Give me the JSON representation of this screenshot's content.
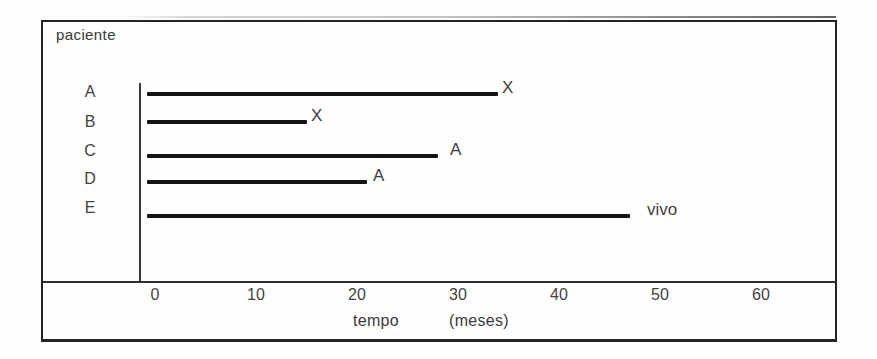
{
  "chart": {
    "y_axis_title": "paciente",
    "x_axis_caption_word": "tempo",
    "x_axis_caption_unit": "(meses)"
  },
  "chart_data": {
    "type": "bar",
    "orientation": "horizontal",
    "title": "",
    "ylabel": "paciente",
    "xlabel": "tempo (meses)",
    "x_ticks": [
      0,
      10,
      20,
      30,
      40,
      50,
      60
    ],
    "xlim": [
      0,
      67
    ],
    "grid": false,
    "legend": false,
    "categories": [
      "A",
      "B",
      "C",
      "D",
      "E"
    ],
    "values": [
      34,
      15,
      28,
      21,
      47
    ],
    "end_markers": [
      "X",
      "X",
      "A",
      "A",
      "vivo"
    ],
    "series": [
      {
        "name": "tempo de seguimento (meses)",
        "values": [
          34,
          15,
          28,
          21,
          47
        ]
      }
    ]
  },
  "colors": {
    "bar_ink": "#141414",
    "axis_ink": "#2e2e2e",
    "text_ink": "#3c3c3c",
    "background": "#fdfdfd"
  }
}
